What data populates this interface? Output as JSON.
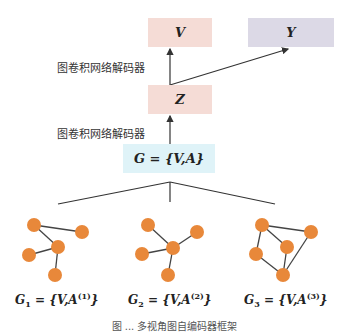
{
  "diagram": {
    "nodes": {
      "V": {
        "label": "V",
        "color": "#f5dcd6"
      },
      "Y": {
        "label": "Y",
        "color": "#dcd9e6"
      },
      "Z": {
        "label": "Z",
        "color": "#f5dcd6"
      },
      "G": {
        "label": "G = {V,A}",
        "color": "#dff3f8"
      }
    },
    "edge_labels": {
      "z_to_v": "图卷积网络解码器",
      "g_to_z": "图卷积网络解码器"
    },
    "views": [
      {
        "name": "G",
        "sub": "1",
        "rest": " = {V,A",
        "sup": "(1)",
        "close": "}"
      },
      {
        "name": "G",
        "sub": "2",
        "rest": " = {V,A",
        "sup": "(2)",
        "close": "}"
      },
      {
        "name": "G",
        "sub": "3",
        "rest": " = {V,A",
        "sup": "(3)",
        "close": "}"
      }
    ],
    "node_color": "#e8883a",
    "caption": "图 ... 多视角图自编码器框架"
  }
}
